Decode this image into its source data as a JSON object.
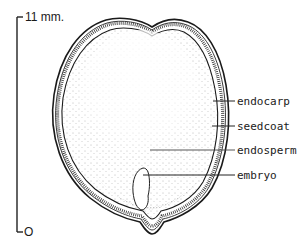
{
  "diagram": {
    "scale": {
      "top_label": "11 mm.",
      "bottom_label": "O"
    },
    "labels": [
      {
        "id": "endocarp",
        "text": "endocarp"
      },
      {
        "id": "seedcoat",
        "text": "seedcoat"
      },
      {
        "id": "endosperm",
        "text": "endosperm"
      },
      {
        "id": "embryo",
        "text": "embryo"
      }
    ]
  }
}
